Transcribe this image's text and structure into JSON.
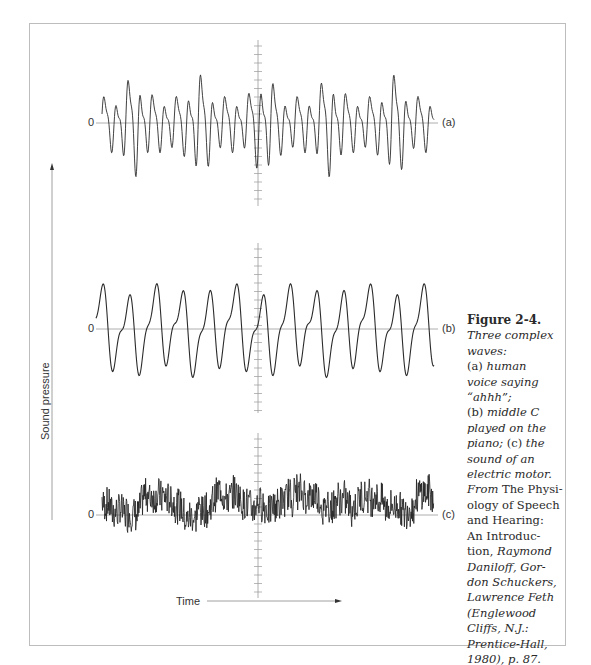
{
  "figure": {
    "label": "Figure 2-4.",
    "caption_lines": [
      {
        "text": "Three complex",
        "style": "italic"
      },
      {
        "text": "waves:",
        "style": "italic"
      },
      {
        "text": "(a) human",
        "style": "mixed",
        "plain": "(a) ",
        "italic": "human"
      },
      {
        "text": "voice saying",
        "style": "italic"
      },
      {
        "text": "“ahhh”;",
        "style": "italic"
      },
      {
        "text": "(b) middle C",
        "style": "mixed",
        "plain": "(b) ",
        "italic": "middle C"
      },
      {
        "text": "played on the",
        "style": "italic"
      },
      {
        "text": "piano; (c) the",
        "style": "mixed2",
        "italic1": "piano; ",
        "plain": "(c) ",
        "italic2": "the"
      },
      {
        "text": "sound of an",
        "style": "italic"
      },
      {
        "text": "electric motor.",
        "style": "italic"
      },
      {
        "text": "From The Physi-",
        "style": "mixed3",
        "italic": "From ",
        "plain": "The Physi-"
      },
      {
        "text": "ology of Speech",
        "style": "plain"
      },
      {
        "text": "and Hearing:",
        "style": "plain"
      },
      {
        "text": "An Introduc-",
        "style": "plain"
      },
      {
        "text": "tion, Raymond",
        "style": "mixed3b",
        "plain": "tion, ",
        "italic": "Raymond"
      },
      {
        "text": "Daniloff, Gor-",
        "style": "italic"
      },
      {
        "text": "don Schuckers,",
        "style": "italic"
      },
      {
        "text": "Lawrence Feth",
        "style": "italic"
      },
      {
        "text": "(Englewood",
        "style": "italic"
      },
      {
        "text": "Cliffs, N.J.:",
        "style": "italic"
      },
      {
        "text": "Prentice-Hall,",
        "style": "italic"
      },
      {
        "text": "1980), p. 87.",
        "style": "italic"
      }
    ]
  },
  "axes": {
    "x_label": "Time",
    "y_label": "Sound pressure",
    "zero_label": "0"
  },
  "chart_data": {
    "type": "line",
    "xlabel": "Time",
    "ylabel": "Sound pressure",
    "grid": false,
    "series": [
      {
        "name": "(a)",
        "label": "(a)",
        "description": "human voice saying \"ahhh\"",
        "style": "quasi-periodic spiky waveform, major peaks roughly every ~65px with smaller oscillations between",
        "y_zero_px": 123
      },
      {
        "name": "(b)",
        "label": "(b)",
        "description": "middle C played on the piano",
        "style": "smooth periodic waveform with rounded peaks",
        "y_zero_px": 329
      },
      {
        "name": "(c)",
        "label": "(c)",
        "description": "sound of an electric motor",
        "style": "dense noisy waveform",
        "y_zero_px": 515
      }
    ]
  },
  "colors": {
    "frame": "#bdbdbd",
    "axis": "#9a9a9a",
    "wave": "#2b2b2b",
    "text": "#2a2a2a"
  }
}
